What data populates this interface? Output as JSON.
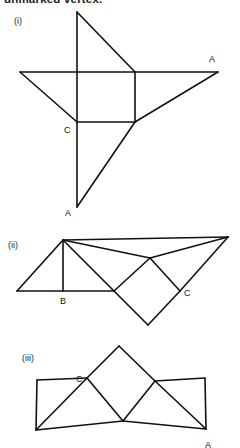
{
  "page": {
    "background_color": "#ffffff",
    "stroke_color": "#111111",
    "text_color": "#111111",
    "width": 240,
    "height": 448,
    "header_text": "unmarked vertex."
  },
  "figures": [
    {
      "caption": "(i)",
      "caption_pos": {
        "x": 14,
        "y": 16
      },
      "labels": [
        {
          "text": "A",
          "x": 209,
          "y": 54
        },
        {
          "text": "C",
          "x": 64,
          "y": 125
        },
        {
          "text": "A",
          "x": 65,
          "y": 208
        }
      ],
      "strokes": [
        "77,12 77,207",
        "77,12 135,72",
        "20,72 218,72",
        "20,72 77,122",
        "135,72 135,122",
        "77,122 135,122",
        "218,72 135,122",
        "135,122 77,207"
      ]
    },
    {
      "caption": "(ii)",
      "caption_pos": {
        "x": 8,
        "y": 240
      },
      "labels": [
        {
          "text": "B",
          "x": 60,
          "y": 296
        },
        {
          "text": "C",
          "x": 184,
          "y": 288
        }
      ],
      "strokes": [
        "17,291 63,240",
        "63,240 63,291",
        "17,291 114,291",
        "63,240 114,291",
        "63,240 150,258",
        "63,240 228,237",
        "228,237 150,258",
        "114,291 150,258",
        "114,291 148,325",
        "148,325 180,291",
        "150,258 180,291",
        "180,291 228,237"
      ]
    },
    {
      "caption": "(iii)",
      "caption_pos": {
        "x": 22,
        "y": 353
      },
      "labels": [
        {
          "text": "C",
          "x": 76,
          "y": 374
        },
        {
          "text": "A",
          "x": 205,
          "y": 440
        }
      ],
      "strokes": [
        "37,380 87,378",
        "37,380 36,430",
        "36,430 123,421",
        "36,430 87,378",
        "87,378 119,346",
        "119,346 155,381",
        "87,378 123,421",
        "123,421 155,381",
        "155,381 205,378",
        "205,378 206,429",
        "123,421 206,429",
        "155,381 206,429"
      ]
    }
  ]
}
